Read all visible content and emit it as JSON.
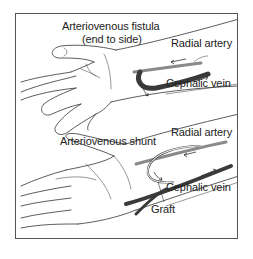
{
  "diagram": {
    "top_panel": {
      "title_line1": "Arteriovenous fistula",
      "title_line2": "(end to side)",
      "label_artery": "Radial artery",
      "label_vein": "Cephalic vein"
    },
    "bottom_panel": {
      "title": "Arteriovenous shunt",
      "label_artery": "Radial artery",
      "label_vein": "Cephalic vein",
      "label_graft": "Graft"
    },
    "colors": {
      "line": "#333333",
      "vein": "#3a3a3a",
      "artery": "#8a8a8a",
      "frame": "#555555"
    }
  }
}
